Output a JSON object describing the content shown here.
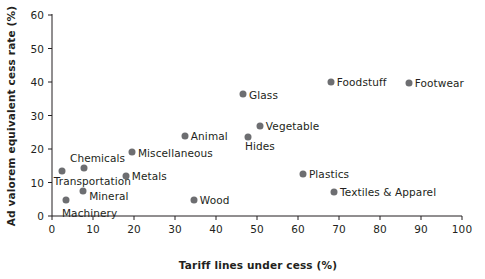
{
  "chart_data": {
    "type": "scatter",
    "title": "",
    "xlabel": "Tariff lines under cess (%)",
    "ylabel": "Ad valorem equivalent cess rate (%)",
    "xlim": [
      0,
      100
    ],
    "ylim": [
      0,
      60
    ],
    "xticks": [
      0,
      10,
      20,
      30,
      40,
      50,
      60,
      70,
      80,
      90,
      100
    ],
    "yticks": [
      0,
      10,
      20,
      30,
      40,
      50,
      60
    ],
    "xtick_labels": [
      "0",
      "10",
      "20",
      "30",
      "40",
      "50",
      "60",
      "70",
      "80",
      "90",
      "100"
    ],
    "ytick_labels": [
      "0",
      "10",
      "20",
      "30",
      "40",
      "50",
      "60"
    ],
    "grid": false,
    "legend": "none",
    "marker_color": "#6d6e71",
    "axis_color": "#231f20",
    "points": [
      {
        "label": "Transportation",
        "x": 2.4,
        "y": 13.4,
        "label_dx": -8,
        "label_dy": 10,
        "label_anchor": "start"
      },
      {
        "label": "Machinery",
        "x": 3.4,
        "y": 4.8,
        "label_dx": -4,
        "label_dy": 13,
        "label_anchor": "start"
      },
      {
        "label": "Chemicals",
        "x": 7.8,
        "y": 14.3,
        "label_dx": -14,
        "label_dy": -10,
        "label_anchor": "start"
      },
      {
        "label": "Mineral",
        "x": 7.6,
        "y": 7.5,
        "label_dx": 6,
        "label_dy": 5,
        "label_anchor": "start"
      },
      {
        "label": "Metals",
        "x": 18.0,
        "y": 11.9,
        "label_dx": 6,
        "label_dy": 0,
        "label_anchor": "start"
      },
      {
        "label": "Miscellaneous",
        "x": 19.5,
        "y": 19.1,
        "label_dx": 6,
        "label_dy": 1,
        "label_anchor": "start"
      },
      {
        "label": "Animal",
        "x": 32.4,
        "y": 23.9,
        "label_dx": 6,
        "label_dy": 0,
        "label_anchor": "start"
      },
      {
        "label": "Wood",
        "x": 34.6,
        "y": 4.8,
        "label_dx": 6,
        "label_dy": 0,
        "label_anchor": "start"
      },
      {
        "label": "Glass",
        "x": 46.6,
        "y": 36.4,
        "label_dx": 6,
        "label_dy": 1,
        "label_anchor": "start"
      },
      {
        "label": "Hides",
        "x": 47.8,
        "y": 23.6,
        "label_dx": -3,
        "label_dy": 9,
        "label_anchor": "start"
      },
      {
        "label": "Vegetable",
        "x": 50.7,
        "y": 26.9,
        "label_dx": 6,
        "label_dy": 0,
        "label_anchor": "start"
      },
      {
        "label": "Plastics",
        "x": 61.2,
        "y": 12.5,
        "label_dx": 6,
        "label_dy": 0,
        "label_anchor": "start"
      },
      {
        "label": "Foodstuff",
        "x": 68.0,
        "y": 40.0,
        "label_dx": 6,
        "label_dy": 0,
        "label_anchor": "start"
      },
      {
        "label": "Textiles & Apparel",
        "x": 68.8,
        "y": 7.2,
        "label_dx": 6,
        "label_dy": 0,
        "label_anchor": "start"
      },
      {
        "label": "Footwear",
        "x": 87.0,
        "y": 39.7,
        "label_dx": 6,
        "label_dy": 0,
        "label_anchor": "start"
      }
    ]
  }
}
